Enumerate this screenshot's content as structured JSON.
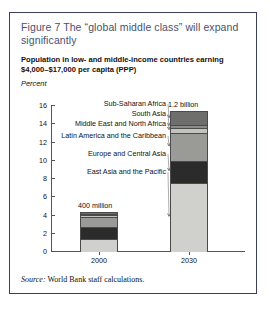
{
  "figure": {
    "title": "Figure 7  The “global middle class” will expand significantly",
    "subtitle": "Population in low- and middle-income countries earning $4,000–$17,000 per capita (PPP)",
    "axis_unit": "Percent",
    "source_word": "Source:",
    "source_text": " World Bank staff calculations."
  },
  "chart_data": {
    "type": "bar",
    "stacked": true,
    "title": "Figure 7  The “global middle class” will expand significantly",
    "subtitle": "Population in low- and middle-income countries earning $4,000–$17,000 per capita (PPP)",
    "xlabel": "",
    "ylabel": "Percent",
    "ylim": [
      0,
      16
    ],
    "yticks": [
      0,
      2,
      4,
      6,
      8,
      10,
      12,
      14,
      16
    ],
    "ytick_labels": [
      "0",
      "2",
      "4",
      "6",
      "8",
      "10",
      "12",
      "14",
      "16"
    ],
    "grid": false,
    "legend_position": "right-annotated-leader-lines",
    "categories": [
      "2000",
      "2030"
    ],
    "series": [
      {
        "name": "East Asia and the Pacific",
        "values": [
          1.4,
          7.6
        ],
        "color": "#d0d0cd"
      },
      {
        "name": "Europe and Central Asia",
        "values": [
          1.3,
          2.4
        ],
        "color": "#2b2b2b"
      },
      {
        "name": "Latin America and the Caribbean",
        "values": [
          1.1,
          3.0
        ],
        "color": "#9a9a97"
      },
      {
        "name": "Middle East and North Africa",
        "values": [
          0.25,
          0.6
        ],
        "color": "#c2c2bf"
      },
      {
        "name": "South Asia",
        "values": [
          0.15,
          0.3
        ],
        "color": "#8c8c8a"
      },
      {
        "name": "Sub-Saharan Africa",
        "values": [
          0.1,
          1.4
        ],
        "color": "#6e6e6c"
      }
    ],
    "totals": [
      4.3,
      15.3
    ],
    "annotations": [
      {
        "category": "2000",
        "text": "400 million"
      },
      {
        "category": "2030",
        "text": "1.2 billion"
      }
    ]
  }
}
